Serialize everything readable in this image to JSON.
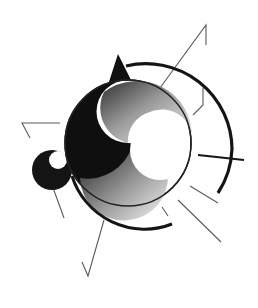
{
  "figure": {
    "type": "abstract-illustration",
    "colors": {
      "background": "#ffffff",
      "ink": "#111111",
      "line": "#555555",
      "gradient_light": "#f2f2f2",
      "gradient_dark": "#3a3a3a"
    },
    "caption": ""
  }
}
